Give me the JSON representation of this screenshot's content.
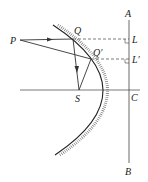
{
  "diagram": {
    "labels": {
      "A": "A",
      "B": "B",
      "C": "C",
      "L": "L",
      "L_prime": "L′",
      "P": "P",
      "Q": "Q",
      "Q_prime": "Q′",
      "S": "S"
    },
    "colors": {
      "line": "#333333",
      "background": "#ffffff"
    }
  }
}
